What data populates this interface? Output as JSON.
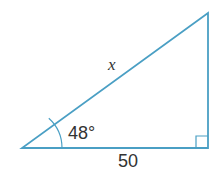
{
  "figure": {
    "type": "right-triangle",
    "stroke_color": "#4a9fc4",
    "text_color": "#333333",
    "vertices": {
      "bottom_left": [
        22,
        148
      ],
      "bottom_right": [
        208,
        148
      ],
      "top_right": [
        208,
        13
      ]
    },
    "labels": {
      "hypotenuse": "x",
      "angle": "48°",
      "base": "50"
    },
    "right_angle_marker": true
  }
}
